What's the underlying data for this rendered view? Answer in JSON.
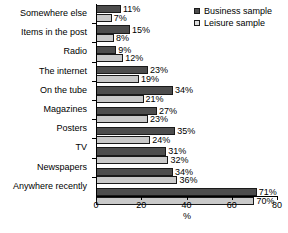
{
  "chart_data": {
    "type": "bar",
    "orientation": "horizontal",
    "title": "",
    "xlabel": "%",
    "ylabel": "",
    "xlim": [
      0,
      80
    ],
    "xticks": [
      0,
      20,
      40,
      60,
      80
    ],
    "grid": false,
    "legend_position": "top-right",
    "categories": [
      "Somewhere else",
      "Items in the post",
      "Radio",
      "The internet",
      "On the tube",
      "Magazines",
      "Posters",
      "TV",
      "Newspapers",
      "Anywhere recently"
    ],
    "series": [
      {
        "name": "Business sample",
        "color": "#4d4d4d",
        "values": [
          11,
          15,
          9,
          23,
          34,
          27,
          35,
          31,
          34,
          71
        ],
        "labels": [
          "11%",
          "15%",
          "9%",
          "23%",
          "34%",
          "27%",
          "35%",
          "31%",
          "34%",
          "71%"
        ]
      },
      {
        "name": "Leisure sample",
        "color": "#c9c9c9",
        "values": [
          7,
          8,
          12,
          19,
          21,
          23,
          24,
          32,
          36,
          70
        ],
        "labels": [
          "7%",
          "8%",
          "12%",
          "19%",
          "21%",
          "23%",
          "24%",
          "32%",
          "36%",
          "70%"
        ]
      }
    ]
  },
  "legend": {
    "items": [
      {
        "label": "Business sample",
        "marker": "filled-dark-square"
      },
      {
        "label": "Leisure sample",
        "marker": "filled-light-square"
      }
    ]
  },
  "axis": {
    "x_title": "%",
    "x_tick_labels": [
      "0",
      "20",
      "40",
      "60",
      "80"
    ]
  }
}
